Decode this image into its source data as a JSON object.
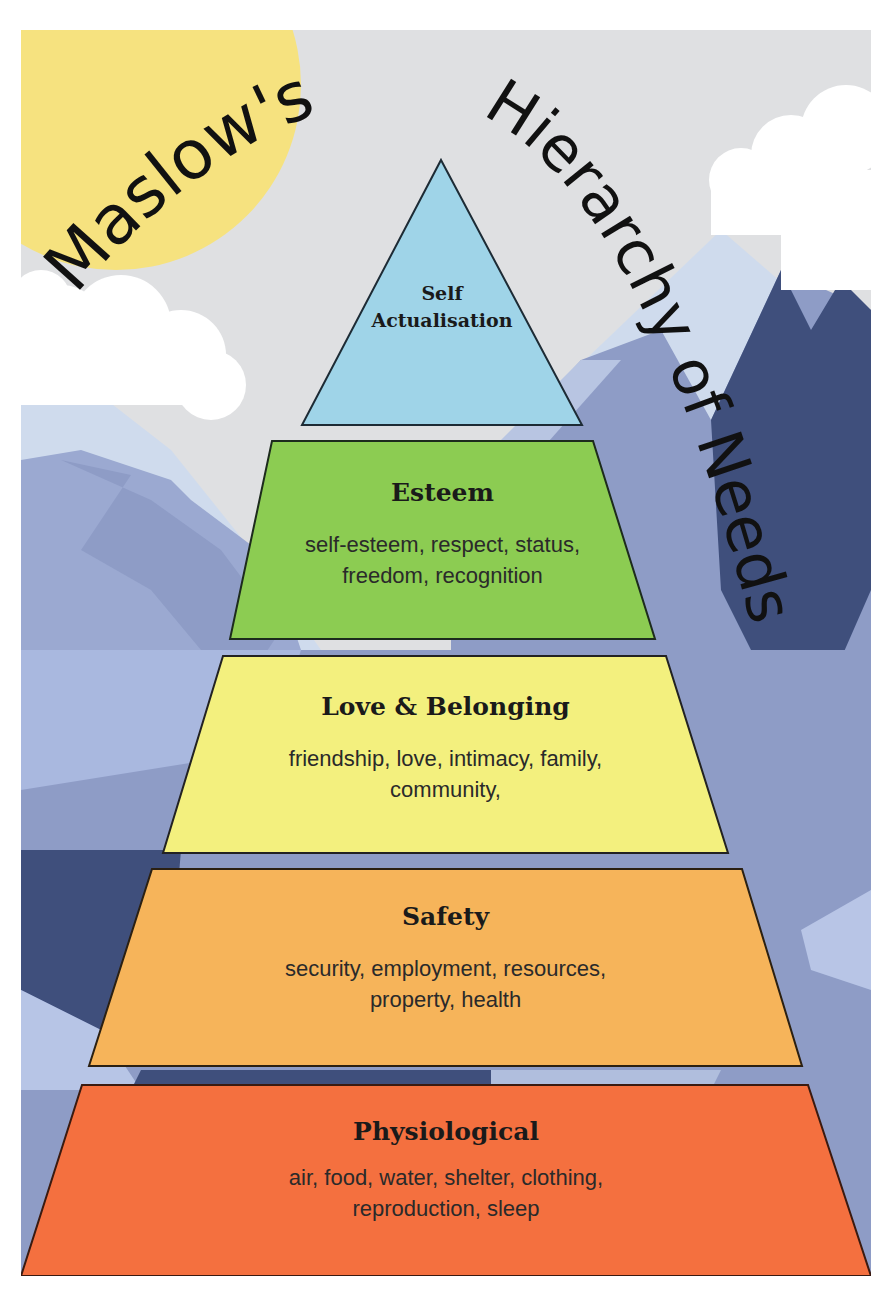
{
  "title": {
    "word1": "Maslow's",
    "word2": "Hierarchy",
    "word3": "of",
    "word4": "Needs"
  },
  "colors": {
    "sky": "#dfe0e2",
    "sun": "#f6e27f",
    "cloud": "#ffffff",
    "mountain_light": "#cfdbed",
    "mountain_mid": "#8e9cc6",
    "mountain_dark": "#3f4f7c",
    "self_actualisation": "#9fd4e8",
    "esteem": "#8ccc52",
    "love_belonging": "#f3f07e",
    "safety": "#f6b45a",
    "physiological": "#f4703f"
  },
  "pyramid": {
    "tiers": [
      {
        "id": "self_actualisation",
        "title_line1": "Self",
        "title_line2": "Actualisation",
        "description_line1": "",
        "description_line2": ""
      },
      {
        "id": "esteem",
        "title": "Esteem",
        "description_line1": "self-esteem, respect, status,",
        "description_line2": "freedom, recognition"
      },
      {
        "id": "love_belonging",
        "title": "Love & Belonging",
        "description_line1": "friendship, love, intimacy, family,",
        "description_line2": "community,"
      },
      {
        "id": "safety",
        "title": "Safety",
        "description_line1": "security, employment, resources,",
        "description_line2": "property, health"
      },
      {
        "id": "physiological",
        "title": "Physiological",
        "description_line1": "air, food, water, shelter, clothing,",
        "description_line2": "reproduction, sleep"
      }
    ]
  }
}
